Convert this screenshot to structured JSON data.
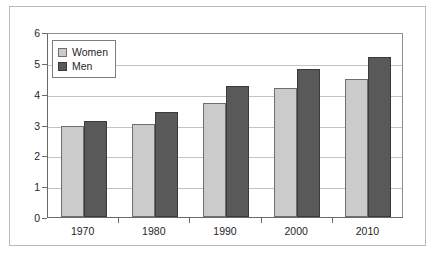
{
  "chart_data": {
    "type": "bar",
    "title": "",
    "xlabel": "",
    "ylabel": "",
    "categories": [
      "1970",
      "1980",
      "1990",
      "2000",
      "2010"
    ],
    "series": [
      {
        "name": "Women",
        "values": [
          2.95,
          3.02,
          3.7,
          4.2,
          4.47
        ],
        "color": "#cbcbcb"
      },
      {
        "name": "Men",
        "values": [
          3.1,
          3.4,
          4.25,
          4.8,
          5.2
        ],
        "color": "#595959"
      }
    ],
    "ylim": [
      0,
      6
    ],
    "yticks": [
      0,
      1,
      2,
      3,
      4,
      5,
      6
    ],
    "ytick_labels": [
      "0",
      "1",
      "2",
      "3",
      "4",
      "5",
      "6"
    ],
    "grid": true,
    "grid_axis": "y",
    "legend_position": "upper left",
    "legend_entries": [
      "Women",
      "Men"
    ]
  },
  "figure": {
    "background": "#ffffff",
    "frame_color": "#b9b9b9",
    "axis_color": "#6a6a6a",
    "gridline_color": "#c3c3c3"
  }
}
